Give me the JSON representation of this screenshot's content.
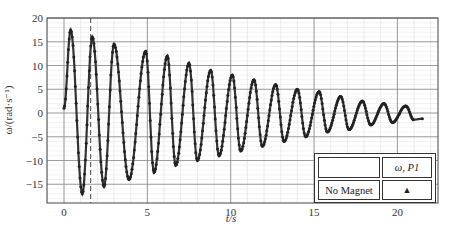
{
  "chart_data": {
    "type": "scatter",
    "title": "",
    "xlabel": "t/s",
    "ylabel": "ω/(rad·s⁻¹)",
    "xlim": [
      -1,
      22.5
    ],
    "ylim": [
      -19,
      20
    ],
    "xticks": [
      0,
      5,
      10,
      15,
      20
    ],
    "yticks": [
      -15,
      -10,
      -5,
      0,
      5,
      10,
      15,
      20
    ],
    "grid": true,
    "dashed_vline_x": 1.6,
    "legend": {
      "position": "lower right",
      "header": [
        "",
        "ω, P1"
      ],
      "rows": [
        [
          "No Magnet",
          "▲"
        ]
      ]
    },
    "series": [
      {
        "name": "ω, P1 (No Magnet)",
        "model": "damped sine",
        "amplitude0": 18,
        "decay_per_s": 0.1,
        "period_s": 1.3,
        "t_start": 0,
        "t_end": 21.5,
        "peaks": [
          {
            "t": 0.4,
            "w": 17.5
          },
          {
            "t": 1.7,
            "w": 16
          },
          {
            "t": 3.0,
            "w": 14.5
          },
          {
            "t": 4.9,
            "w": 13
          },
          {
            "t": 6.2,
            "w": 12
          },
          {
            "t": 7.5,
            "w": 10.5
          },
          {
            "t": 8.8,
            "w": 9
          },
          {
            "t": 10.1,
            "w": 8
          },
          {
            "t": 11.4,
            "w": 7
          },
          {
            "t": 12.7,
            "w": 6
          },
          {
            "t": 14.0,
            "w": 5
          },
          {
            "t": 15.3,
            "w": 4.5
          },
          {
            "t": 16.6,
            "w": 3.5
          },
          {
            "t": 17.9,
            "w": 2.5
          },
          {
            "t": 19.2,
            "w": 2
          },
          {
            "t": 20.5,
            "w": 1.5
          }
        ],
        "troughs": [
          {
            "t": 1.1,
            "w": -17
          },
          {
            "t": 2.4,
            "w": -15.5
          },
          {
            "t": 3.9,
            "w": -14
          },
          {
            "t": 5.4,
            "w": -12.5
          },
          {
            "t": 6.7,
            "w": -11
          },
          {
            "t": 8.0,
            "w": -10
          },
          {
            "t": 9.3,
            "w": -9
          },
          {
            "t": 10.6,
            "w": -8
          },
          {
            "t": 11.9,
            "w": -7
          },
          {
            "t": 13.2,
            "w": -6
          },
          {
            "t": 14.5,
            "w": -5
          },
          {
            "t": 15.8,
            "w": -4
          },
          {
            "t": 17.1,
            "w": -3.5
          },
          {
            "t": 18.4,
            "w": -2.5
          },
          {
            "t": 19.7,
            "w": -2
          },
          {
            "t": 21.0,
            "w": -1.5
          }
        ]
      }
    ]
  },
  "axes": {
    "xlabel": "t/s",
    "ylabel": "ω/(rad·s⁻¹)"
  },
  "legend": {
    "header_left": "",
    "header_right": "ω, P1",
    "row_label": "No Magnet",
    "row_marker": "▲"
  }
}
